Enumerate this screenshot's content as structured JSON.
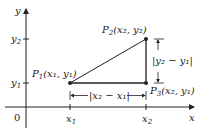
{
  "diagram": {
    "axes": {
      "x_label": "x",
      "y_label": "y",
      "origin_label": "0"
    },
    "ticks": {
      "x": [
        {
          "label": "x",
          "sub": "1"
        },
        {
          "label": "x",
          "sub": "2"
        }
      ],
      "y": [
        {
          "label": "y",
          "sub": "1"
        },
        {
          "label": "y",
          "sub": "2"
        }
      ]
    },
    "points": {
      "p1": {
        "name": "P",
        "sub": "1",
        "coords": "(x₁, y₁)"
      },
      "p2": {
        "name": "P",
        "sub": "2",
        "coords": "(x₂, y₂)"
      },
      "p3": {
        "name": "P",
        "sub": "3",
        "coords": "(x₂, y₁)"
      }
    },
    "dimensions": {
      "horizontal": "|x₂ − x₁|",
      "vertical": "|y₂ − y₁|"
    },
    "colors": {
      "ink": "#222222",
      "background": "#ffffff"
    }
  }
}
